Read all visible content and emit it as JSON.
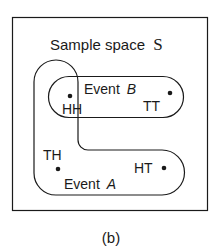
{
  "diagram": {
    "title": "Sample space",
    "title_symbol": "S",
    "caption": "(b)",
    "events": [
      {
        "name": "Event",
        "letter": "B",
        "outcomes": [
          "HH",
          "TT"
        ]
      },
      {
        "name": "Event",
        "letter": "A",
        "outcomes": [
          "HH",
          "TH",
          "HT"
        ]
      }
    ],
    "outcomes": [
      "HH",
      "TT",
      "TH",
      "HT"
    ],
    "colors": {
      "ink": "#1a1a1a",
      "background": "#ffffff"
    }
  }
}
